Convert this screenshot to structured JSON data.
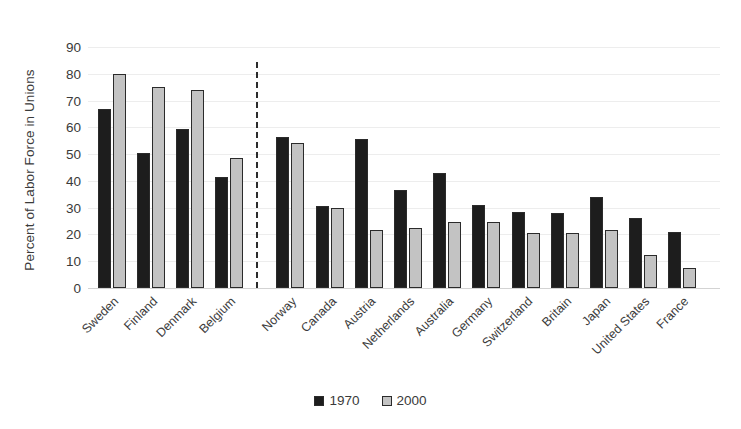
{
  "chart_data": {
    "type": "bar",
    "title": "",
    "xlabel": "",
    "ylabel": "Percent of Labor Force in Unions",
    "ylim": [
      0,
      90
    ],
    "ytick_step": 10,
    "yticks": [
      90,
      80,
      70,
      60,
      50,
      40,
      30,
      20,
      10,
      0
    ],
    "grid": true,
    "legend_position": "bottom-center",
    "categories": [
      "Sweden",
      "Finland",
      "Denmark",
      "Belgium",
      "Norway",
      "Canada",
      "Austria",
      "Netherlands",
      "Australia",
      "Germany",
      "Switzerland",
      "Britain",
      "Japan",
      "United States",
      "France"
    ],
    "series": [
      {
        "name": "1970",
        "color": "#1d1d1d",
        "values": [
          67,
          50.5,
          59.5,
          41.5,
          56.5,
          30.5,
          55.5,
          36.5,
          43,
          31,
          28.5,
          28,
          34,
          26,
          21
        ]
      },
      {
        "name": "2000",
        "color": "#c3c3c3",
        "values": [
          80,
          75,
          74,
          48.5,
          54,
          30,
          21.5,
          22.5,
          24.5,
          24.5,
          20.5,
          20.5,
          21.5,
          12.5,
          7.5
        ]
      }
    ],
    "group_break_after_index": 3,
    "annotations": [
      {
        "type": "vertical-dashed-divider",
        "after_category": "Belgium"
      }
    ]
  },
  "legend": {
    "entries": [
      {
        "label": "1970"
      },
      {
        "label": "2000"
      }
    ]
  }
}
